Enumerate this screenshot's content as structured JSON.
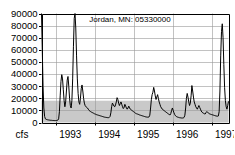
{
  "chart_data": {
    "type": "line",
    "title": "Jordan, MN: 05330000",
    "xlabel": "",
    "ylabel": "cfs",
    "ylim": [
      0,
      90000
    ],
    "xlim": [
      1992.62,
      1997.42
    ],
    "grid": true,
    "legend": "none",
    "yticks": [
      0,
      10000,
      20000,
      30000,
      40000,
      50000,
      60000,
      70000,
      80000,
      90000
    ],
    "ytick_labels": [
      "0",
      "10000",
      "20000",
      "30000",
      "40000",
      "50000",
      "60000",
      "70000",
      "80000",
      "90000"
    ],
    "xticks": [
      1993,
      1994,
      1995,
      1996,
      1997
    ],
    "xtick_labels": [
      "1993",
      "1994",
      "1995",
      "1996",
      "1997"
    ],
    "shaded_band": {
      "y_from": 0,
      "y_to": 18000,
      "color": "#c9c9c9",
      "label": ""
    },
    "line_color": "#000000",
    "series": [
      {
        "name": "discharge",
        "x": [
          1992.62,
          1992.64,
          1992.66,
          1992.68,
          1992.7,
          1992.72,
          1992.74,
          1992.76,
          1992.78,
          1992.8,
          1992.82,
          1992.84,
          1992.86,
          1992.88,
          1992.9,
          1992.92,
          1992.94,
          1992.96,
          1992.98,
          1993.0,
          1993.02,
          1993.04,
          1993.06,
          1993.08,
          1993.1,
          1993.12,
          1993.14,
          1993.16,
          1993.18,
          1993.2,
          1993.22,
          1993.24,
          1993.26,
          1993.28,
          1993.3,
          1993.32,
          1993.34,
          1993.36,
          1993.38,
          1993.4,
          1993.42,
          1993.44,
          1993.46,
          1993.48,
          1993.5,
          1993.52,
          1993.54,
          1993.56,
          1993.58,
          1993.6,
          1993.62,
          1993.64,
          1993.66,
          1993.68,
          1993.7,
          1993.72,
          1993.74,
          1993.76,
          1993.78,
          1993.8,
          1993.82,
          1993.84,
          1993.86,
          1993.88,
          1993.9,
          1993.92,
          1993.94,
          1993.96,
          1993.98,
          1994.0,
          1994.02,
          1994.04,
          1994.06,
          1994.08,
          1994.1,
          1994.12,
          1994.14,
          1994.16,
          1994.18,
          1994.2,
          1994.22,
          1994.24,
          1994.26,
          1994.28,
          1994.3,
          1994.32,
          1994.34,
          1994.36,
          1994.38,
          1994.4,
          1994.42,
          1994.44,
          1994.46,
          1994.48,
          1994.5,
          1994.52,
          1994.54,
          1994.56,
          1994.58,
          1994.6,
          1994.62,
          1994.64,
          1994.66,
          1994.68,
          1994.7,
          1994.72,
          1994.74,
          1994.76,
          1994.78,
          1994.8,
          1994.82,
          1994.84,
          1994.86,
          1994.88,
          1994.9,
          1994.92,
          1994.94,
          1994.96,
          1994.98,
          1995.0,
          1995.02,
          1995.04,
          1995.06,
          1995.08,
          1995.1,
          1995.12,
          1995.14,
          1995.16,
          1995.18,
          1995.2,
          1995.22,
          1995.24,
          1995.26,
          1995.28,
          1995.3,
          1995.32,
          1995.34,
          1995.36,
          1995.38,
          1995.4,
          1995.42,
          1995.44,
          1995.46,
          1995.48,
          1995.5,
          1995.52,
          1995.54,
          1995.56,
          1995.58,
          1995.6,
          1995.62,
          1995.64,
          1995.66,
          1995.68,
          1995.7,
          1995.72,
          1995.74,
          1995.76,
          1995.78,
          1995.8,
          1995.82,
          1995.84,
          1995.86,
          1995.88,
          1995.9,
          1995.92,
          1995.94,
          1995.96,
          1995.98,
          1996.0,
          1996.02,
          1996.04,
          1996.06,
          1996.08,
          1996.1,
          1996.12,
          1996.14,
          1996.16,
          1996.18,
          1996.2,
          1996.22,
          1996.24,
          1996.26,
          1996.28,
          1996.3,
          1996.32,
          1996.34,
          1996.36,
          1996.38,
          1996.4,
          1996.42,
          1996.44,
          1996.46,
          1996.48,
          1996.5,
          1996.52,
          1996.54,
          1996.56,
          1996.58,
          1996.6,
          1996.62,
          1996.64,
          1996.66,
          1996.68,
          1996.7,
          1996.72,
          1996.74,
          1996.76,
          1996.78,
          1996.8,
          1996.82,
          1996.84,
          1996.86,
          1996.88,
          1996.9,
          1996.92,
          1996.94,
          1996.96,
          1996.98,
          1997.0,
          1997.02,
          1997.04,
          1997.06,
          1997.08,
          1997.1,
          1997.12,
          1997.14,
          1997.16,
          1997.18,
          1997.2,
          1997.22,
          1997.24,
          1997.26,
          1997.28,
          1997.3,
          1997.32,
          1997.34,
          1997.36,
          1997.38,
          1997.4,
          1997.42
        ],
        "values": [
          90000,
          60000,
          30000,
          12000,
          5000,
          3000,
          2600,
          2400,
          2200,
          2100,
          2000,
          1900,
          1800,
          1800,
          1700,
          1700,
          1600,
          1600,
          1600,
          1600,
          1700,
          2000,
          3000,
          9000,
          22000,
          34000,
          39500,
          36000,
          27000,
          18000,
          13000,
          17000,
          26000,
          35000,
          38000,
          30000,
          20000,
          14000,
          12000,
          18000,
          36000,
          63000,
          86000,
          91000,
          78000,
          55000,
          36000,
          24000,
          17000,
          15000,
          20000,
          28000,
          31000,
          26000,
          20000,
          16000,
          14000,
          13000,
          12500,
          12000,
          11000,
          10000,
          9500,
          9000,
          8600,
          8200,
          8000,
          7600,
          7200,
          7000,
          6600,
          6400,
          6200,
          6000,
          5800,
          5600,
          5400,
          5200,
          5000,
          4800,
          4600,
          4400,
          4300,
          4200,
          4100,
          4000,
          4000,
          4200,
          5000,
          8000,
          13000,
          16000,
          15000,
          13500,
          13000,
          14500,
          17000,
          20500,
          19000,
          16000,
          14000,
          15500,
          17000,
          15000,
          13000,
          11500,
          12500,
          15000,
          13500,
          12000,
          11000,
          12000,
          13500,
          12000,
          11000,
          10500,
          10000,
          9500,
          9000,
          8600,
          8000,
          7500,
          7200,
          7000,
          6800,
          6500,
          6200,
          6000,
          5800,
          5600,
          5400,
          5200,
          5000,
          4800,
          4600,
          4500,
          4400,
          4400,
          4600,
          6000,
          12000,
          19000,
          23000,
          25000,
          29000,
          26000,
          22000,
          19000,
          21000,
          23000,
          20000,
          17000,
          15000,
          13000,
          12000,
          11000,
          10500,
          10000,
          9500,
          9000,
          8500,
          8000,
          7500,
          7000,
          6600,
          6200,
          7500,
          10000,
          12000,
          10000,
          8000,
          6500,
          5500,
          5000,
          4600,
          4400,
          4200,
          4000,
          3900,
          3800,
          3700,
          3700,
          3800,
          4200,
          6000,
          12000,
          20000,
          24000,
          21000,
          17000,
          14000,
          16000,
          22000,
          30500,
          26000,
          21000,
          17000,
          15000,
          13000,
          12000,
          11000,
          12500,
          14000,
          12500,
          11000,
          9500,
          8500,
          8000,
          7600,
          7200,
          7000,
          8000,
          9000,
          8500,
          8000,
          7500,
          7000,
          6800,
          6600,
          6400,
          6200,
          6000,
          5800,
          5600,
          5400,
          5300,
          5200,
          5400,
          9000,
          26000,
          55000,
          75000,
          81500,
          70000,
          48000,
          29000,
          18000,
          13000,
          11000,
          14000,
          17500
        ]
      }
    ]
  },
  "axis": {
    "unit_label": "cfs"
  }
}
